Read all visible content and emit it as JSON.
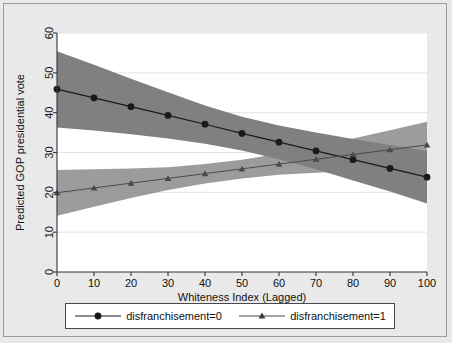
{
  "chart_data": {
    "type": "line",
    "title": "",
    "subtitle": "",
    "xlabel": "Whiteness Index (Lagged)",
    "ylabel": "Predicted GOP presidential vote",
    "xlim": [
      0,
      100
    ],
    "ylim": [
      0,
      60
    ],
    "xticks": [
      0,
      10,
      20,
      30,
      40,
      50,
      60,
      70,
      80,
      90,
      100
    ],
    "yticks": [
      0,
      10,
      20,
      30,
      40,
      50,
      60
    ],
    "grid": true,
    "grid_axis": "y",
    "legend_position": "bottom",
    "x": [
      0,
      10,
      20,
      30,
      40,
      50,
      60,
      70,
      80,
      90,
      100
    ],
    "series": [
      {
        "name": "disfranchisement=0",
        "marker": "circle",
        "color": "#1a1a1a",
        "band_color": "#808080",
        "values": [
          45.9,
          43.7,
          41.5,
          39.3,
          37.1,
          34.8,
          32.6,
          30.4,
          28.2,
          26.0,
          23.8
        ],
        "ci_lower": [
          36.3,
          35.5,
          34.6,
          33.5,
          32.2,
          30.5,
          28.3,
          25.8,
          23.0,
          20.2,
          17.2
        ],
        "ci_upper": [
          55.4,
          52.0,
          48.5,
          45.1,
          41.8,
          39.0,
          36.8,
          35.0,
          33.4,
          31.9,
          30.4
        ]
      },
      {
        "name": "disfranchisement=1",
        "marker": "triangle",
        "color": "#4a4a4a",
        "band_color": "#808080",
        "values": [
          19.9,
          21.1,
          22.3,
          23.5,
          24.7,
          25.9,
          27.1,
          28.3,
          29.5,
          30.7,
          31.9
        ],
        "ci_lower": [
          14.1,
          16.4,
          18.6,
          20.6,
          22.2,
          23.5,
          24.4,
          24.9,
          25.3,
          25.6,
          25.9
        ],
        "ci_upper": [
          25.6,
          25.8,
          26.0,
          26.3,
          27.1,
          28.2,
          29.7,
          31.5,
          33.5,
          35.6,
          37.7
        ]
      }
    ]
  },
  "legend": {
    "items": [
      {
        "label": "disfranchisement=0",
        "marker": "circle-marker"
      },
      {
        "label": "disfranchisement=1",
        "marker": "triangle-marker"
      }
    ]
  },
  "colors": {
    "page_background": "#e9e9e9",
    "plot_background": "#ffffff",
    "band": "#808080",
    "band_overlap": "#5e5e5e",
    "line_dark": "#1a1a1a",
    "line_mid": "#4a4a4a",
    "frame": "#9a9a9a",
    "axis": "#333333",
    "grid": "#e4e4e4"
  }
}
